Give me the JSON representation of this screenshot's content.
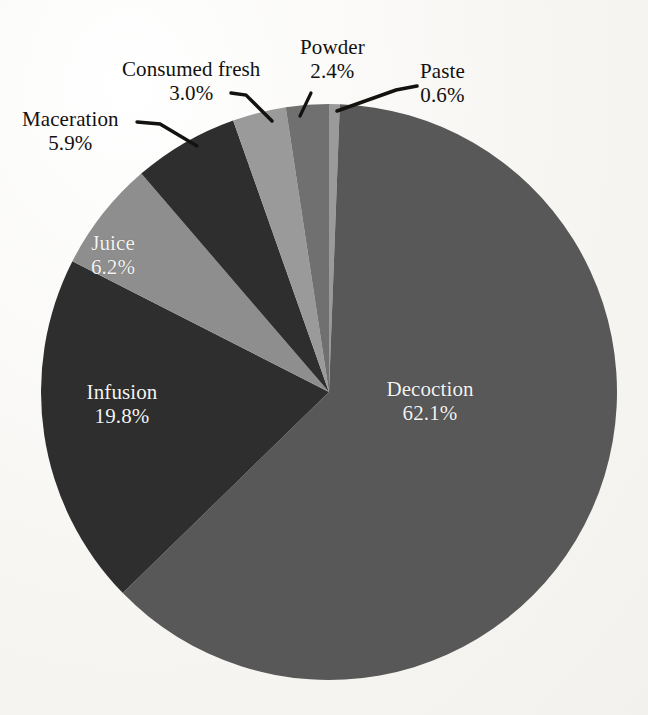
{
  "chart_data": {
    "type": "pie",
    "title": "",
    "subtitle": "",
    "xlabel": "",
    "ylabel": "",
    "legend": "none",
    "grid": false,
    "units": "percent",
    "start_angle_deg": 0,
    "direction": "clockwise",
    "categories": [
      "Paste",
      "Decoction",
      "Infusion",
      "Maceration",
      "Juice",
      "Consumed fresh",
      "Powder"
    ],
    "slices": [
      {
        "name": "Paste",
        "label": "Paste",
        "value": 0.6,
        "pct_text": "0.6%",
        "color": "#9a9a9a",
        "label_placement": "outside",
        "label_color": "#13110f"
      },
      {
        "name": "Decoction",
        "label": "Decoction",
        "value": 62.1,
        "pct_text": "62.1%",
        "color": "#585858",
        "label_placement": "inside",
        "label_color": "#f4f4f2"
      },
      {
        "name": "Infusion",
        "label": "Infusion",
        "value": 19.8,
        "pct_text": "19.8%",
        "color": "#2e2e2e",
        "label_placement": "inside",
        "label_color": "#f4f4f2"
      },
      {
        "name": "Juice",
        "label": "Juice",
        "value": 6.2,
        "pct_text": "6.2%",
        "color": "#8e8e8e",
        "label_placement": "inside",
        "label_color": "#f4f4f2"
      },
      {
        "name": "Maceration",
        "label": "Maceration",
        "value": 5.9,
        "pct_text": "5.9%",
        "color": "#2f2f2f",
        "label_placement": "outside",
        "label_color": "#13110f"
      },
      {
        "name": "Consumed fresh",
        "label": "Consumed fresh",
        "value": 3.0,
        "pct_text": "3.0%",
        "color": "#9a9a9a",
        "label_placement": "outside",
        "label_color": "#13110f"
      },
      {
        "name": "Powder",
        "label": "Powder",
        "value": 2.4,
        "pct_text": "2.4%",
        "color": "#6f6f6f",
        "label_placement": "outside",
        "label_color": "#13110f"
      }
    ],
    "total": 100.0,
    "background_color": "#f7f6f3",
    "leader_line_color": "#14120f"
  },
  "labels": {
    "maceration": {
      "name": "Maceration",
      "pct": "5.9%"
    },
    "consumed_fresh": {
      "name": "Consumed fresh",
      "pct": "3.0%"
    },
    "powder": {
      "name": "Powder",
      "pct": "2.4%"
    },
    "paste": {
      "name": "Paste",
      "pct": "0.6%"
    },
    "juice": {
      "name": "Juice",
      "pct": "6.2%"
    },
    "infusion": {
      "name": "Infusion",
      "pct": "19.8%"
    },
    "decoction": {
      "name": "Decoction",
      "pct": "62.1%"
    }
  }
}
